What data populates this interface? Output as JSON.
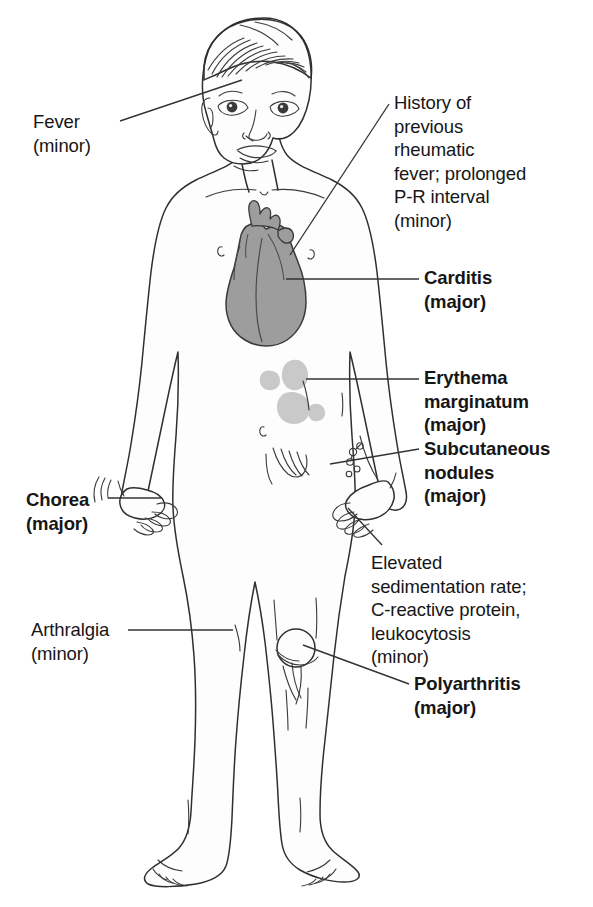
{
  "figure": {
    "colors": {
      "outline": "#2b2b2b",
      "heart_fill": "#9a9a9a",
      "heart_outline": "#3a3a3a",
      "erythema_fill": "#c9c9c9",
      "skin_fill": "#fcfcfc",
      "text": "#161616",
      "leader_line": "#333333"
    }
  },
  "labels": [
    {
      "id": "fever",
      "name": "Fever",
      "text": "Fever\n(minor)",
      "severity": "minor",
      "weight": "normal",
      "side": "left",
      "x": 33,
      "y": 110,
      "leader": {
        "x1": 120,
        "y1": 121,
        "x2": 242,
        "y2": 80
      }
    },
    {
      "id": "history",
      "name": "History of previous rheumatic fever; prolonged P-R interval",
      "text": "History of\nprevious\nrheumatic\nfever; prolonged\nP-R interval\n(minor)",
      "severity": "minor",
      "weight": "normal",
      "side": "right",
      "x": 394,
      "y": 91,
      "leader": {
        "x1": 389,
        "y1": 104,
        "x2": 290,
        "y2": 255
      }
    },
    {
      "id": "carditis",
      "name": "Carditis",
      "text": "Carditis\n(major)",
      "severity": "major",
      "weight": "bold",
      "side": "right",
      "x": 424,
      "y": 266,
      "leader": {
        "x1": 419,
        "y1": 279,
        "x2": 286,
        "y2": 279
      }
    },
    {
      "id": "erythema-marginatum",
      "name": "Erythema marginatum",
      "text": "Erythema\nmarginatum\n(major)",
      "severity": "major",
      "weight": "bold",
      "side": "right",
      "x": 424,
      "y": 366,
      "leader": {
        "x1": 419,
        "y1": 379,
        "x2": 306,
        "y2": 379
      }
    },
    {
      "id": "subcutaneous-nodules",
      "name": "Subcutaneous nodules",
      "text": "Subcutaneous\nnodules\n(major)",
      "severity": "major",
      "weight": "bold",
      "side": "right",
      "x": 424,
      "y": 437,
      "leader": {
        "x1": 419,
        "y1": 449,
        "x2": 330,
        "y2": 464
      }
    },
    {
      "id": "chorea",
      "name": "Chorea",
      "text": "Chorea\n(major)",
      "severity": "major",
      "weight": "bold",
      "side": "left",
      "x": 26,
      "y": 488,
      "leader": {
        "x1": 108,
        "y1": 498,
        "x2": 161,
        "y2": 498
      }
    },
    {
      "id": "elevated-esr",
      "name": "Elevated sedimentation rate; C-reactive protein, leukocytosis",
      "text": "Elevated\nsedimentation rate;\nC-reactive protein,\nleukocytosis\n(minor)",
      "severity": "minor",
      "weight": "normal",
      "side": "right",
      "x": 371,
      "y": 551,
      "leader": {
        "x1": 382,
        "y1": 545,
        "x2": 348,
        "y2": 508
      }
    },
    {
      "id": "arthralgia",
      "name": "Arthralgia",
      "text": "Arthralgia\n(minor)",
      "severity": "minor",
      "weight": "normal",
      "side": "left",
      "x": 31,
      "y": 618,
      "leader": {
        "x1": 128,
        "y1": 630,
        "x2": 233,
        "y2": 630
      }
    },
    {
      "id": "polyarthritis",
      "name": "Polyarthritis",
      "text": "Polyarthritis\n(major)",
      "severity": "major",
      "weight": "bold",
      "side": "right",
      "x": 414,
      "y": 672,
      "leader": {
        "x1": 409,
        "y1": 684,
        "x2": 303,
        "y2": 645
      }
    }
  ],
  "anatomy": {
    "heart_label": "heart",
    "erythema_patches_count": 4,
    "nodules_count": 5,
    "knee_joint_label": "left knee joint"
  },
  "caption": {
    "text": "",
    "note": "clipped at image edge"
  }
}
